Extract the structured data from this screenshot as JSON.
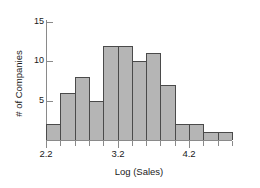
{
  "chart_data": {
    "type": "bar",
    "title": "",
    "subtitle": "",
    "xlabel": "Log (Sales)",
    "ylabel": "# of Companies",
    "grid": false,
    "legend": null,
    "xlim": [
      2.2,
      4.8
    ],
    "ylim": [
      0,
      15
    ],
    "xtick_labels": [
      "2.2",
      "3.2",
      "4.2"
    ],
    "xtick_values": [
      2.2,
      3.2,
      4.2
    ],
    "ytick_labels": [
      "5",
      "10",
      "15"
    ],
    "ytick_values": [
      5,
      10,
      15
    ],
    "bin_width": 0.2,
    "bin_starts": [
      2.2,
      2.4,
      2.6,
      2.8,
      3.0,
      3.2,
      3.4,
      3.6,
      3.8,
      4.0,
      4.2,
      4.4,
      4.6
    ],
    "categories": [
      "2.2-2.4",
      "2.4-2.6",
      "2.6-2.8",
      "2.8-3.0",
      "3.0-3.2",
      "3.2-3.4",
      "3.4-3.6",
      "3.6-3.8",
      "3.8-4.0",
      "4.0-4.2",
      "4.2-4.4",
      "4.4-4.6",
      "4.6-4.8"
    ],
    "values": [
      2,
      6,
      8,
      5,
      12,
      12,
      10,
      11,
      7,
      2,
      2,
      1,
      1
    ]
  },
  "style": {
    "bar_fill": "#b5b5b5",
    "bar_stroke": "#4a4a4a",
    "axis_color": "#8a8a8a",
    "text_color": "#1a1a1a",
    "background": "#ffffff"
  }
}
